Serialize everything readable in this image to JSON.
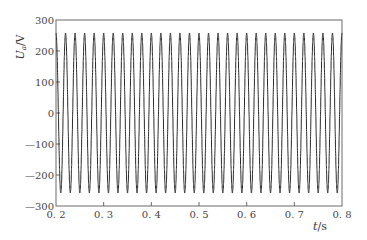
{
  "chart_data": {
    "type": "line",
    "title": "",
    "xlabel": "t/s",
    "ylabel": "U_a/V",
    "xlabel_parts": {
      "var": "t",
      "unit": "/s"
    },
    "ylabel_parts": {
      "var": "U",
      "sub": "a",
      "unit": "/V"
    },
    "xlim": [
      0.2,
      0.8
    ],
    "ylim": [
      -300,
      300
    ],
    "xticks": [
      0.2,
      0.3,
      0.4,
      0.5,
      0.6,
      0.7,
      0.8
    ],
    "xtick_labels": [
      "0.2",
      "0.3",
      "0.4",
      "0.5",
      "0.6",
      "0.7",
      "0.8"
    ],
    "yticks": [
      300,
      200,
      100,
      0,
      -100,
      -200,
      -300
    ],
    "ytick_labels": [
      "300",
      "200",
      "100",
      "0",
      "-100",
      "-200",
      "-300"
    ],
    "grid": false,
    "legend": null,
    "series": [
      {
        "name": "U_a",
        "waveform": "sine",
        "amplitude": 258,
        "frequency_hz": 50,
        "phase_reference_t": 0.2,
        "phase": "cosine",
        "stair_steps_per_cycle": 24,
        "t_start": 0.2,
        "t_end": 0.8,
        "color": "#2a2a2a"
      }
    ]
  },
  "style": {
    "frame_color": "#6a6a6a",
    "text_color": "#444444",
    "background": "#ffffff"
  }
}
